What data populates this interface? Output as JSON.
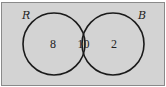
{
  "diagram": {
    "type": "venn",
    "sets": [
      {
        "name": "R",
        "only_count": "8"
      },
      {
        "name": "B",
        "only_count": "2"
      }
    ],
    "intersection_count": "10",
    "colors": {
      "background": "#d3d3d3",
      "border": "#8a8a8a",
      "circle_stroke": "#1a1a1a"
    }
  }
}
